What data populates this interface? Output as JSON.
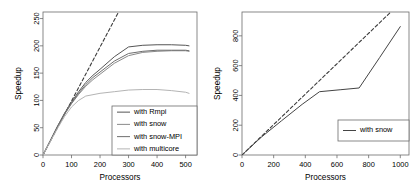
{
  "figure": {
    "background": "#ffffff",
    "panels": [
      "left-speedup-chart",
      "right-speedup-chart"
    ]
  },
  "chart_data": [
    {
      "id": "left-speedup-chart",
      "type": "line",
      "title": "",
      "xlabel": "Processors",
      "ylabel": "Speedup",
      "xlim": [
        0,
        540
      ],
      "ylim": [
        0,
        262
      ],
      "xticks": [
        0,
        100,
        200,
        300,
        400,
        500
      ],
      "yticks": [
        0,
        50,
        100,
        150,
        200,
        250
      ],
      "grid": false,
      "box": true,
      "legend": {
        "position": "bottom-right",
        "entries": [
          {
            "name": "with Rmpi",
            "color": "#555555",
            "dash": "none"
          },
          {
            "name": "with snow",
            "color": "#8a8a8a",
            "dash": "none"
          },
          {
            "name": "with snow-MPI",
            "color": "#6e6e6e",
            "dash": "none"
          },
          {
            "name": "with multicore",
            "color": "#b4b4b4",
            "dash": "none"
          }
        ]
      },
      "series": [
        {
          "name": "linear reference",
          "color": "#3c3c3c",
          "dash": "dashed",
          "in_legend": false,
          "x": [
            0,
            265
          ],
          "y": [
            0,
            262
          ]
        },
        {
          "name": "with Rmpi",
          "color": "#555555",
          "dash": "none",
          "x": [
            0,
            25,
            50,
            75,
            100,
            125,
            150,
            175,
            200,
            250,
            300,
            350,
            400,
            450,
            500,
            512
          ],
          "y": [
            0,
            26,
            52,
            76,
            97,
            116,
            133,
            146,
            157,
            180,
            198,
            201,
            202,
            202,
            201,
            200
          ]
        },
        {
          "name": "with snow",
          "color": "#8a8a8a",
          "dash": "none",
          "x": [
            0,
            25,
            50,
            75,
            100,
            125,
            150,
            175,
            200,
            250,
            300,
            350,
            400,
            450,
            500,
            512
          ],
          "y": [
            0,
            25,
            50,
            74,
            94,
            111,
            126,
            138,
            148,
            168,
            182,
            188,
            190,
            191,
            191,
            190
          ]
        },
        {
          "name": "with snow-MPI",
          "color": "#6e6e6e",
          "dash": "none",
          "x": [
            0,
            25,
            50,
            75,
            100,
            125,
            150,
            175,
            200,
            250,
            300,
            350,
            400,
            450,
            500,
            512
          ],
          "y": [
            0,
            25,
            51,
            75,
            95,
            113,
            129,
            142,
            152,
            172,
            186,
            190,
            192,
            192,
            192,
            191
          ]
        },
        {
          "name": "with multicore",
          "color": "#b4b4b4",
          "dash": "none",
          "x": [
            0,
            25,
            50,
            75,
            100,
            125,
            150,
            200,
            250,
            300,
            350,
            400,
            450,
            500,
            512
          ],
          "y": [
            0,
            24,
            48,
            70,
            88,
            100,
            108,
            113,
            116,
            119,
            120,
            120,
            118,
            115,
            113
          ]
        }
      ]
    },
    {
      "id": "right-speedup-chart",
      "type": "line",
      "title": "",
      "xlabel": "Processors",
      "ylabel": "Speedup",
      "xlim": [
        0,
        1055
      ],
      "ylim": [
        0,
        960
      ],
      "xticks": [
        0,
        200,
        400,
        600,
        800,
        1000
      ],
      "yticks": [
        0,
        200,
        400,
        600,
        800
      ],
      "grid": false,
      "box": true,
      "legend": {
        "position": "bottom-right",
        "entries": [
          {
            "name": "with snow",
            "color": "#444444",
            "dash": "none"
          }
        ]
      },
      "series": [
        {
          "name": "linear reference",
          "color": "#3c3c3c",
          "dash": "dashed",
          "in_legend": false,
          "x": [
            0,
            940
          ],
          "y": [
            0,
            960
          ]
        },
        {
          "name": "with snow",
          "color": "#444444",
          "dash": "none",
          "in_legend": true,
          "x": [
            0,
            120,
            250,
            380,
            490,
            620,
            740,
            870,
            1000
          ],
          "y": [
            0,
            118,
            230,
            340,
            425,
            438,
            450,
            655,
            862
          ]
        }
      ]
    }
  ]
}
